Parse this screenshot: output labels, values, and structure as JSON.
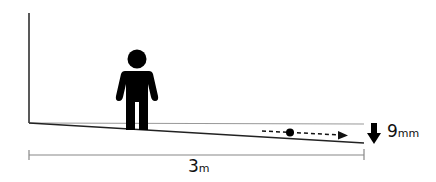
{
  "diagram": {
    "length_measure": {
      "value": "3",
      "unit": "m"
    },
    "drop_measure": {
      "value": "9",
      "unit": "mm"
    },
    "elements": {
      "wall": "vertical-wall-line",
      "level_reference": "horizontal-level-line",
      "sloped_floor": "sloped-floor-line",
      "person": "person-icon",
      "ball": "rolling-ball-icon",
      "motion_arrow": "dashed-arrow-right",
      "drop_arrow": "down-arrow-icon",
      "dimension_line": "length-dimension-line"
    },
    "colors": {
      "stroke": "#222222",
      "fill": "#000000",
      "dimension": "#888888"
    }
  }
}
